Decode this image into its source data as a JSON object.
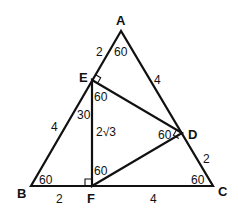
{
  "diagram": {
    "points": {
      "A": {
        "label": "A",
        "x": 121,
        "y": 31
      },
      "B": {
        "label": "B",
        "x": 31,
        "y": 186
      },
      "C": {
        "label": "C",
        "x": 213,
        "y": 186
      },
      "D": {
        "label": "D",
        "x": 182,
        "y": 133
      },
      "E": {
        "label": "E",
        "x": 92,
        "y": 80
      },
      "F": {
        "label": "F",
        "x": 92,
        "y": 186
      }
    },
    "segment_labels": {
      "AE": "2",
      "AD": "4",
      "EB": "4",
      "DC": "2",
      "BF": "2",
      "FC": "4",
      "EF": "2√3"
    },
    "angle_labels": {
      "A": "60",
      "B": "60",
      "C": "60",
      "E_lower": "60",
      "E_left": "30",
      "D": "60",
      "F": "60"
    },
    "right_angles": [
      "E",
      "D",
      "F"
    ]
  }
}
